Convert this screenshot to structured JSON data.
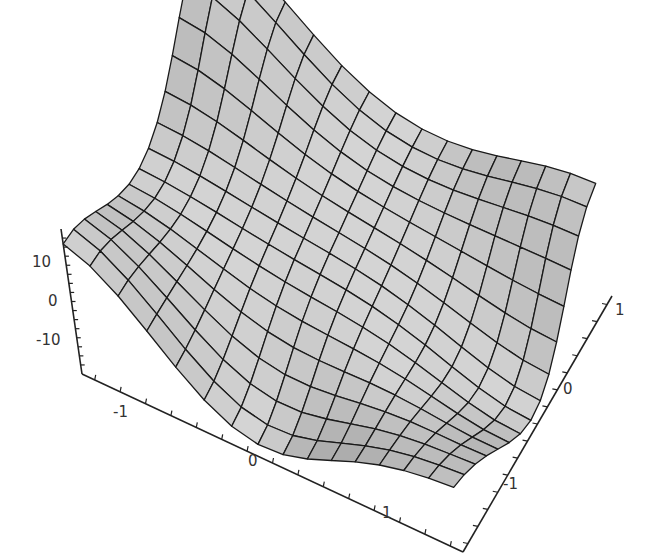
{
  "chart_data": {
    "type": "surface3d",
    "title": "",
    "xlabel": "",
    "ylabel": "",
    "zlabel": "",
    "x_range": [
      -1.5,
      1.5
    ],
    "y_range": [
      -1.5,
      1.5
    ],
    "z_range": [
      -16,
      16
    ],
    "mesh_cells": 15,
    "x_ticks": [
      {
        "value": -1,
        "label": "-1"
      },
      {
        "value": 0,
        "label": "0"
      },
      {
        "value": 1,
        "label": "1"
      }
    ],
    "y_ticks": [
      {
        "value": -1,
        "label": "-1"
      },
      {
        "value": 0,
        "label": "0"
      },
      {
        "value": 1,
        "label": "1"
      }
    ],
    "z_ticks": [
      {
        "value": 10,
        "label": "10"
      },
      {
        "value": 0,
        "label": "0"
      },
      {
        "value": -10,
        "label": "-10"
      }
    ],
    "surface_model": {
      "description": "three-lobed saddle surface: peaks at left and back corners, valleys at front-edge middle and right-edge middle",
      "peaks": [
        {
          "x": -1.5,
          "y": -1.5,
          "z": 15
        },
        {
          "x": -1.5,
          "y": 1.5,
          "z": 26
        },
        {
          "x": 1.5,
          "y": 1.5,
          "z": 10
        }
      ],
      "valleys": [
        {
          "x": -0.2,
          "y": -1.5,
          "z": -15
        },
        {
          "x": 1.5,
          "y": 0.0,
          "z": -14
        }
      ]
    },
    "style": {
      "surface_fill": "#b8b8b8",
      "mesh_color": "#1a1a1a",
      "axis_color": "#222222",
      "box": false
    }
  }
}
